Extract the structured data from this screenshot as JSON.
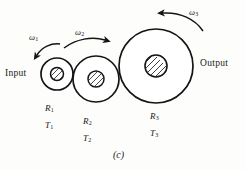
{
  "figure": {
    "caption": "(c)",
    "stroke_color": "#141414",
    "hatch_color": "#2a2a2a",
    "background": "#fdfdfc",
    "input_label": "Input",
    "output_label": "Output",
    "gears": [
      {
        "id": "gear-1",
        "radius_label": "R",
        "radius_sub": "1",
        "torque_label": "T",
        "torque_sub": "1",
        "omega_label": "ω",
        "omega_sub": "1",
        "cx": 57,
        "cy": 74,
        "r_outer": 16,
        "r_hub": 6.5
      },
      {
        "id": "gear-2",
        "radius_label": "R",
        "radius_sub": "2",
        "torque_label": "T",
        "torque_sub": "2",
        "omega_label": "ω",
        "omega_sub": "2",
        "cx": 96,
        "cy": 79,
        "r_outer": 23,
        "r_hub": 8
      },
      {
        "id": "gear-3",
        "radius_label": "R",
        "radius_sub": "3",
        "torque_label": "T",
        "torque_sub": "3",
        "omega_label": "ω",
        "omega_sub": "3",
        "cx": 156,
        "cy": 66,
        "r_outer": 37,
        "r_hub": 11
      }
    ]
  }
}
